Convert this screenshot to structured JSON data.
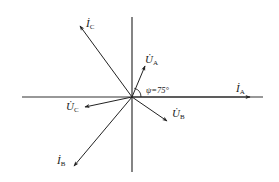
{
  "diagram": {
    "type": "phasor-diagram",
    "axes": {
      "horizontal": true,
      "vertical": true
    },
    "phasors": [
      {
        "id": "IA",
        "label": "İ",
        "subscript": "A",
        "kind": "current",
        "angle_deg": 0
      },
      {
        "id": "UA",
        "label": "U̇",
        "subscript": "A",
        "kind": "voltage",
        "angle_deg": 75
      },
      {
        "id": "IC",
        "label": "İ",
        "subscript": "C",
        "kind": "current",
        "angle_deg": 127
      },
      {
        "id": "UC",
        "label": "U̇",
        "subscript": "C",
        "kind": "voltage",
        "angle_deg": 191
      },
      {
        "id": "UB",
        "label": "U̇",
        "subscript": "B",
        "kind": "voltage",
        "angle_deg": -35
      },
      {
        "id": "IB",
        "label": "İ",
        "subscript": "B",
        "kind": "current",
        "angle_deg": 233
      }
    ],
    "angle_annotation": {
      "text": "ψ=75°",
      "between": [
        "IA",
        "UA"
      ]
    },
    "colors": {
      "stroke": "#333333",
      "text": "#1a1a1a"
    }
  }
}
